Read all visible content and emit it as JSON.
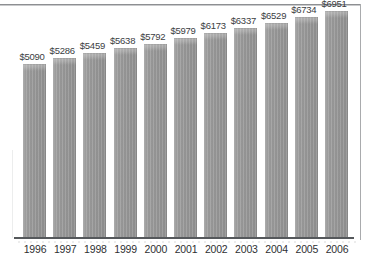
{
  "figure": {
    "background_color": "#ffffff",
    "bar_color": "#9b9b9b",
    "axis_color": "#55585b",
    "label_color": "#3b3d3f"
  },
  "chart_data": {
    "type": "bar",
    "title": "",
    "subtitle": "",
    "xlabel": "",
    "ylabel": "",
    "grid": false,
    "legend": false,
    "ylim": [
      0,
      7400
    ],
    "categories": [
      "1996",
      "1997",
      "1998",
      "1999",
      "2000",
      "2001",
      "2002",
      "2003",
      "2004",
      "2005",
      "2006"
    ],
    "values": [
      5090,
      5286,
      5459,
      5638,
      5792,
      5979,
      6173,
      6337,
      6529,
      6734,
      6951
    ],
    "data_labels": [
      "$5090",
      "$5286",
      "$5459",
      "$5638",
      "$5792",
      "$5979",
      "$6173",
      "$6337",
      "$6529",
      "$6734",
      "$6951"
    ],
    "tick_labels": [
      "1996",
      "1997",
      "1998",
      "1999",
      "2000",
      "2001",
      "2002",
      "2003",
      "2004",
      "2005",
      "2006"
    ]
  }
}
